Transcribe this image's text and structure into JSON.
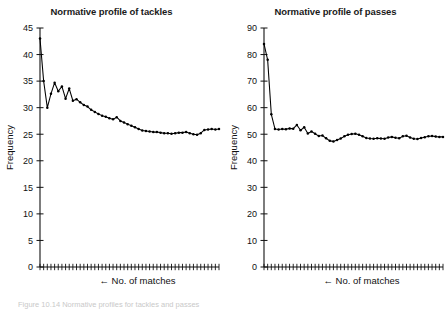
{
  "figure": {
    "caption": "Figure 10.14 Normative profiles for tackles and passes"
  },
  "chart_data": [
    {
      "type": "line",
      "id": "tackles",
      "title": "Normative profile of tackles",
      "xlabel": "No. of matches",
      "ylabel": "Frequency",
      "xlabel_arrow": "←",
      "ylim": [
        0,
        45
      ],
      "yticks": [
        0,
        5,
        10,
        15,
        20,
        25,
        30,
        35,
        40,
        45
      ],
      "grid": false,
      "legend": "none",
      "x": [
        1,
        2,
        3,
        4,
        5,
        6,
        7,
        8,
        9,
        10,
        11,
        12,
        13,
        14,
        15,
        16,
        17,
        18,
        19,
        20,
        21,
        22,
        23,
        24,
        25,
        26,
        27,
        28,
        29,
        30,
        31,
        32,
        33,
        34,
        35,
        36,
        37,
        38,
        39,
        40,
        41,
        42,
        43,
        44,
        45,
        46,
        47,
        48,
        49,
        50
      ],
      "values": [
        43.0,
        35.0,
        30.0,
        32.6,
        34.7,
        33.1,
        34.0,
        31.7,
        33.6,
        31.3,
        31.6,
        31.0,
        30.5,
        30.2,
        29.6,
        29.2,
        28.8,
        28.5,
        28.3,
        28.0,
        27.8,
        28.2,
        27.5,
        27.2,
        26.9,
        26.6,
        26.3,
        26.0,
        25.7,
        25.6,
        25.5,
        25.4,
        25.4,
        25.3,
        25.2,
        25.2,
        25.1,
        25.2,
        25.3,
        25.3,
        25.4,
        25.2,
        25.0,
        24.9,
        25.2,
        25.8,
        25.9,
        26.0,
        25.9,
        26.0
      ]
    },
    {
      "type": "line",
      "id": "passes",
      "title": "Normative profile of passes",
      "xlabel": "No. of matches",
      "ylabel": "Frequency",
      "xlabel_arrow": "←",
      "ylim": [
        0,
        90
      ],
      "yticks": [
        0,
        10,
        20,
        30,
        40,
        50,
        60,
        70,
        80,
        90
      ],
      "grid": false,
      "legend": "none",
      "x": [
        1,
        2,
        3,
        4,
        5,
        6,
        7,
        8,
        9,
        10,
        11,
        12,
        13,
        14,
        15,
        16,
        17,
        18,
        19,
        20,
        21,
        22,
        23,
        24,
        25,
        26,
        27,
        28,
        29,
        30,
        31,
        32,
        33,
        34,
        35,
        36,
        37,
        38,
        39,
        40,
        41,
        42,
        43,
        44,
        45,
        46,
        47,
        48,
        49,
        50
      ],
      "values": [
        84.0,
        78.0,
        57.5,
        52.0,
        51.8,
        52.0,
        51.9,
        52.2,
        52.1,
        53.5,
        51.5,
        52.6,
        50.3,
        51.0,
        50.2,
        49.3,
        49.5,
        48.5,
        47.5,
        47.3,
        47.8,
        48.4,
        49.2,
        49.8,
        50.1,
        50.2,
        49.8,
        49.2,
        48.6,
        48.4,
        48.3,
        48.5,
        48.4,
        48.3,
        48.8,
        49.0,
        48.7,
        48.5,
        49.2,
        49.4,
        48.8,
        48.3,
        48.2,
        48.6,
        48.9,
        49.2,
        49.3,
        49.1,
        49.0,
        49.0
      ]
    }
  ]
}
